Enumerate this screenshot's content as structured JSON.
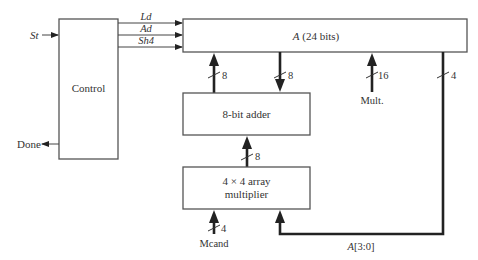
{
  "diagram": {
    "blocks": {
      "control": {
        "label": "Control"
      },
      "register_a": {
        "label_var": "A",
        "label_rest": " (24 bits)"
      },
      "adder": {
        "label": "8-bit adder"
      },
      "multiplier": {
        "label_line1": "4 × 4 array",
        "label_line2": "multiplier"
      }
    },
    "signals": {
      "start": "St",
      "done": "Done",
      "load": "Ld",
      "add": "Ad",
      "shift": "Sh4"
    },
    "buses": {
      "adder_to_a_width": "8",
      "a_to_adder_width": "8",
      "mult_input_width": "16",
      "a_low_width": "4",
      "mult_to_adder_width": "8",
      "mcand_width": "4"
    },
    "inputs": {
      "multiplier_input": "Mult.",
      "multiplicand_input": "Mcand"
    },
    "feedback": {
      "label_var": "A",
      "label_rest": "[3:0]"
    }
  }
}
